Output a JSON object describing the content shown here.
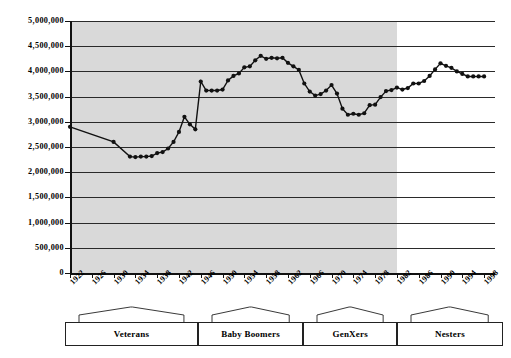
{
  "figure": {
    "title": "",
    "caption": ""
  },
  "chart_data": {
    "type": "line",
    "title": "",
    "xlabel": "",
    "ylabel": "",
    "grid": true,
    "legend": "none",
    "xlim": [
      1922,
      2000
    ],
    "ylim": [
      0,
      5000000
    ],
    "ytick_step": 500000,
    "ytick_labels": [
      "5,000,000",
      "4,500,000",
      "4,000,000",
      "3,500,000",
      "3,000,000",
      "2,500,000",
      "2,000,000",
      "1,500,000",
      "1,000,000",
      "500,000",
      "0"
    ],
    "ytick_values": [
      5000000,
      4500000,
      4000000,
      3500000,
      3000000,
      2500000,
      2000000,
      1500000,
      1000000,
      500000,
      0
    ],
    "xtick_labels": [
      "1922",
      "1926",
      "1930",
      "1934",
      "1938",
      "1942",
      "1946",
      "1950",
      "1954",
      "1958",
      "1962",
      "1966",
      "1970",
      "1974",
      "1978",
      "1982",
      "1986",
      "1990",
      "1994",
      "1998"
    ],
    "xtick_values": [
      1922,
      1926,
      1930,
      1934,
      1938,
      1942,
      1946,
      1950,
      1954,
      1958,
      1962,
      1966,
      1970,
      1974,
      1978,
      1982,
      1986,
      1990,
      1994,
      1998
    ],
    "marker": "filled-circle",
    "line_color": "#111111",
    "marker_color": "#111111",
    "shaded_band": {
      "x_start": 1922,
      "x_end": 1982,
      "color": "#d9d9d9"
    },
    "series": [
      {
        "name": "Births",
        "x": [
          1922,
          1930,
          1933,
          1934,
          1935,
          1936,
          1937,
          1938,
          1939,
          1940,
          1941,
          1942,
          1943,
          1944,
          1945,
          1946,
          1947,
          1948,
          1949,
          1950,
          1951,
          1952,
          1953,
          1954,
          1955,
          1956,
          1957,
          1958,
          1959,
          1960,
          1961,
          1962,
          1963,
          1964,
          1965,
          1966,
          1967,
          1968,
          1969,
          1970,
          1971,
          1972,
          1973,
          1974,
          1975,
          1976,
          1977,
          1978,
          1979,
          1980,
          1981,
          1982,
          1983,
          1984,
          1985,
          1986,
          1987,
          1988,
          1989,
          1990,
          1991,
          1992,
          1993,
          1994,
          1995,
          1996,
          1997,
          1998
        ],
        "y": [
          2900000,
          2600000,
          2310000,
          2300000,
          2310000,
          2310000,
          2320000,
          2380000,
          2400000,
          2470000,
          2600000,
          2800000,
          3100000,
          2950000,
          2850000,
          3800000,
          3620000,
          3620000,
          3620000,
          3640000,
          3820000,
          3910000,
          3960000,
          4080000,
          4100000,
          4220000,
          4310000,
          4250000,
          4270000,
          4260000,
          4270000,
          4170000,
          4100000,
          4030000,
          3760000,
          3600000,
          3520000,
          3550000,
          3620000,
          3730000,
          3560000,
          3260000,
          3140000,
          3160000,
          3140000,
          3170000,
          3330000,
          3340000,
          3490000,
          3610000,
          3630000,
          3680000,
          3640000,
          3670000,
          3760000,
          3760000,
          3810000,
          3910000,
          4040000,
          4160000,
          4110000,
          4070000,
          4000000,
          3950000,
          3900000,
          3900000,
          3900000,
          3900000
        ]
      }
    ]
  },
  "generations": {
    "items": [
      {
        "label": "Veterans",
        "start": 1922,
        "end": 1945
      },
      {
        "label": "Baby Boomers",
        "start": 1946,
        "end": 1964
      },
      {
        "label": "GenXers",
        "start": 1965,
        "end": 1981
      },
      {
        "label": "Nesters",
        "start": 1982,
        "end": 2000
      }
    ]
  }
}
